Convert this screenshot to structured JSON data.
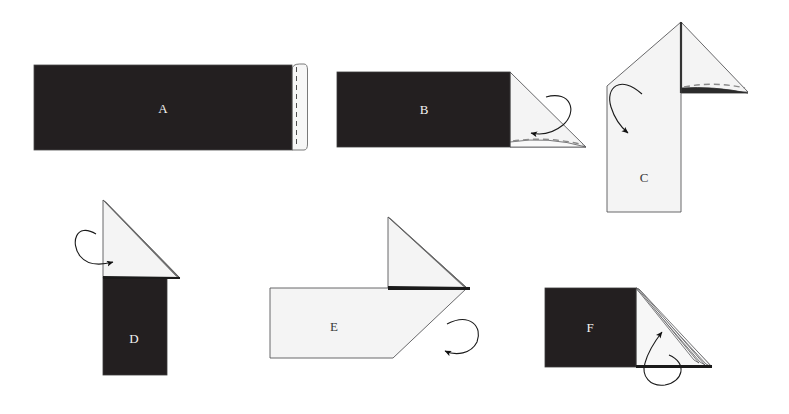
{
  "figure": {
    "background_color": "#ffffff",
    "paper_dark_color": "#231f20",
    "paper_light_color": "#f4f4f4",
    "outline_color": "#58585a",
    "fold_line_color": "#8a8a8a",
    "arrow_color": "#1a1a1a",
    "steps": [
      {
        "id": "A",
        "label": "A",
        "label_color": "#f2f2f2",
        "description": "Dark rectangular strip with a narrow white flap on the right edge and a dashed fold line",
        "has_arrow": false,
        "has_dashed_fold": true
      },
      {
        "id": "B",
        "label": "B",
        "label_color": "#f2f2f2",
        "description": "Dark rectangle with a white triangular flap folded out at the right end, dashed fold line along the bottom and a curved fold arrow",
        "has_arrow": true,
        "has_dashed_fold": true
      },
      {
        "id": "C",
        "label": "C",
        "label_color": "#3a3a3a",
        "description": "Upright white pentagon body with a triangular flap extending to the right, dashed fold line and a curved fold arrow",
        "has_arrow": true,
        "has_dashed_fold": true
      },
      {
        "id": "D",
        "label": "D",
        "label_color": "#f2f2f2",
        "description": "White triangle sitting on top of a dark vertical rectangle with a curved fold arrow on the left",
        "has_arrow": true,
        "has_dashed_fold": false
      },
      {
        "id": "E",
        "label": "E",
        "label_color": "#3a3a3a",
        "description": "White body with an angled lower-right corner and a white triangle above the right end, with a curved fold arrow",
        "has_arrow": true,
        "has_dashed_fold": false
      },
      {
        "id": "F",
        "label": "F",
        "label_color": "#f2f2f2",
        "description": "Dark rectangle with a layered thin triangular fan of folded paper at the right and a curved fold arrow below",
        "has_arrow": true,
        "has_dashed_fold": false
      }
    ]
  }
}
